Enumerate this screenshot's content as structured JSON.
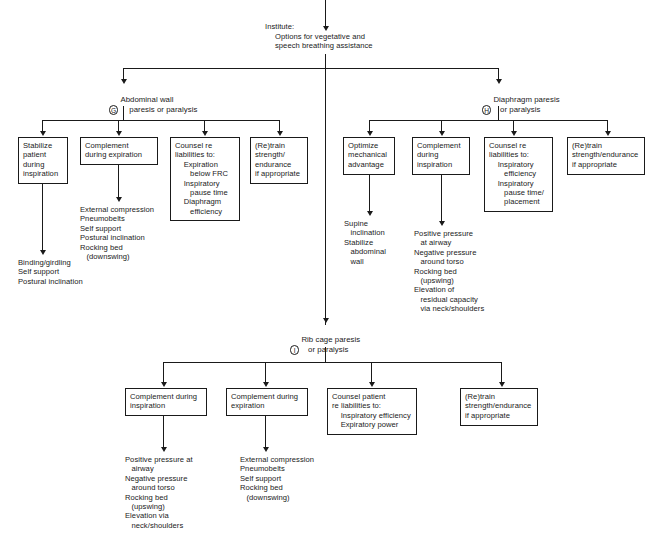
{
  "diagram": {
    "title_label": "Institute:",
    "title_text": "Options for vegetative and\nspeech breathing assistance",
    "nodes": {
      "g": {
        "letter": "G",
        "label": "Abdominal wall\n    paresis or paralysis"
      },
      "h": {
        "letter": "H",
        "label": "Diaphragm paresis\n   or paralysis"
      },
      "i": {
        "letter": "I",
        "label": "Rib cage paresis\n   or paralysis"
      }
    },
    "branch_g": {
      "boxes": [
        {
          "name": "stabilize-patient",
          "text": "Stabilize\npatient\nduring\ninspiration"
        },
        {
          "name": "complement-expiration",
          "text": "Complement\nduring expiration"
        },
        {
          "name": "counsel-liabilities",
          "text": "Counsel re\nliabilities to:\n    Expiration\n       below FRC\n    Inspiratory\n       pause time\n    Diaphragm\n       efficiency"
        },
        {
          "name": "retrain-strength",
          "text": "(Re)train\nstrength/\nendurance\nif appropriate"
        }
      ],
      "outcomes": [
        {
          "name": "stabilize-outcomes",
          "text": "Binding/girdling\nSelf support\nPostural inclination"
        },
        {
          "name": "complement-expiration-outcomes",
          "text": "External compression\nPneumobelts\nSelf support\nPostural inclination\nRocking bed\n   (downswing)"
        }
      ]
    },
    "branch_h": {
      "boxes": [
        {
          "name": "optimize-mechanical",
          "text": "Optimize\nmechanical\nadvantage"
        },
        {
          "name": "complement-inspiration",
          "text": "Complement\nduring\ninspiration"
        },
        {
          "name": "counsel-liabilities",
          "text": "Counsel re\nliabilities to:\n    Inspiratory\n       efficiency\n    Inspiratory\n       pause time/\n       placement"
        },
        {
          "name": "retrain-strength",
          "text": "(Re)train\nstrength/endurance\nif appropriate"
        }
      ],
      "outcomes": [
        {
          "name": "optimize-mechanical-outcomes",
          "text": "Supine\n   inclination\nStabilize\n   abdominal\n   wall"
        },
        {
          "name": "complement-inspiration-outcomes",
          "text": "Positive pressure\n   at airway\nNegative pressure\n   around torso\nRocking bed\n   (upswing)\nElevation of\n   residual capacity\n   via neck/shoulders"
        }
      ]
    },
    "branch_i": {
      "boxes": [
        {
          "name": "complement-inspiration",
          "text": "Complement during\ninspiration"
        },
        {
          "name": "complement-expiration",
          "text": "Complement during\nexpiration"
        },
        {
          "name": "counsel-patient",
          "text": "Counsel patient\nre liabilities to:\n    Inspiratory efficiency\n    Expiratory power"
        },
        {
          "name": "retrain-strength",
          "text": "(Re)train\nstrength/endurance\nif appropriate"
        }
      ],
      "outcomes": [
        {
          "name": "complement-inspiration-outcomes",
          "text": "Positive pressure at\n   airway\nNegative pressure\n   around torso\nRocking bed\n   (upswing)\nElevation via\n   neck/shoulders"
        },
        {
          "name": "complement-expiration-outcomes",
          "text": "External compression\nPneumobelts\nSelf support\nRocking bed\n   (downswing)"
        }
      ]
    }
  }
}
